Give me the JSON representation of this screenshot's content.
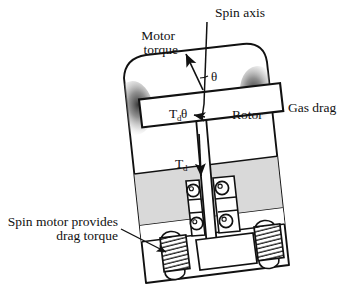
{
  "figure": {
    "title_alt": "Spin-axis rotor assembly with gas drag and spin motor",
    "background_color": "#ffffff",
    "line_color": "#111111",
    "shade_band_color": "#d9d9d9",
    "gradient_dark": "#3a3a3a",
    "gradient_light": "#ffffff"
  },
  "labels": {
    "spin_axis": "Spin axis",
    "motor_torque_line1": "Motor",
    "motor_torque_line2": "torque",
    "theta": "θ",
    "rotor": "Rotor",
    "gas_drag": "Gas drag",
    "torque_damp_symbol": "T",
    "torque_damp_subscript": "d",
    "torque_damp_theta": "θ",
    "torque_d_symbol": "T",
    "torque_d_subscript": "d",
    "spin_motor_line1": "Spin motor provides",
    "spin_motor_line2": "drag torque"
  },
  "components": {
    "housing": "tilted-rounded-housing",
    "rotor_box": "rotor-block",
    "shaft": "spin-shaft",
    "bearings_count": 4,
    "motor_coils_count": 2,
    "gas_drag_blobs": 2
  },
  "annotations": {
    "angle_symbol": "θ",
    "arrow_motor_torque": "up-left-arrow",
    "arrow_drag_torque": "down-arrow",
    "arrow_rotor_torque": "left-arrow",
    "leader_spin_motor": "leader-arrow"
  }
}
